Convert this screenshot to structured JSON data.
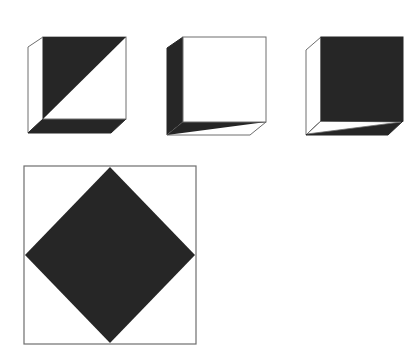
{
  "figure": {
    "colors": {
      "dark": "#262626",
      "light": "#ffffff",
      "edge": "#6e6e6e"
    },
    "cubes": [
      {
        "id": "cube-1",
        "front_face": "dark triangle top-left half (diagonal from top-right to bottom-left)",
        "left_face": "white",
        "bottom_face": "dark"
      },
      {
        "id": "cube-2",
        "front_face": "white",
        "left_face": "dark",
        "bottom_face": "half dark (upper-left triangle), half white"
      },
      {
        "id": "cube-3",
        "front_face": "dark",
        "left_face": "white",
        "bottom_face": "half white (upper-left triangle), half dark"
      }
    ],
    "square_pattern": {
      "id": "large-square",
      "fill": "white square with dark diamond touching midpoints of each edge"
    }
  }
}
